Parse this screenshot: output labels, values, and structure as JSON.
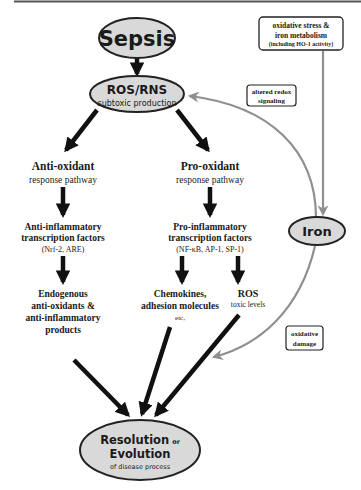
{
  "colors": {
    "node_fill": "#d9d9d9",
    "node_stroke": "#222222",
    "arrow_black": "#111111",
    "arrow_gray": "#8f8f8f",
    "text": "#1a1a1a",
    "top_rule": "#555555"
  },
  "nodes": {
    "sepsis": {
      "label": "Sepsis"
    },
    "ros_rns": {
      "title": "ROS/RNS",
      "subtitle": "subtoxic production"
    },
    "iron": {
      "label": "Iron"
    },
    "resolution": {
      "line1_main": "Resolution",
      "line1_small": "or",
      "line2": "Evolution",
      "line3": "of disease process"
    }
  },
  "boxes": {
    "oxidative_stress": {
      "line1": "oxidative stress &",
      "line2": "iron metabolism",
      "line3": "(including HO-1 activity)"
    },
    "altered_redox": {
      "line1": "altered redox",
      "line2": "signaling"
    },
    "oxidative_damage": {
      "line1": "oxidative",
      "line2": "damage"
    }
  },
  "left_branch": {
    "pathway_title": "Anti-oxidant",
    "pathway_sub": "response pathway",
    "tf_line1": "Anti-inflammatory",
    "tf_line2": "transcription factors",
    "tf_examples": "(Nrf-2, ARE)",
    "products_line1": "Endogenous",
    "products_line2": "anti-oxidants &",
    "products_line3": "anti-inflammatory",
    "products_line4": "products"
  },
  "right_branch": {
    "pathway_title": "Pro-oxidant",
    "pathway_sub": "response pathway",
    "tf_line1": "Pro-inflammatory",
    "tf_line2": "transcription factors",
    "tf_examples": "(NF-κB, AP-1, SP-1)",
    "chemo_line1": "Chemokines,",
    "chemo_line2": "adhesion molecules",
    "chemo_line3": "etc,",
    "ros_title": "ROS",
    "ros_sub": "toxic levels"
  }
}
